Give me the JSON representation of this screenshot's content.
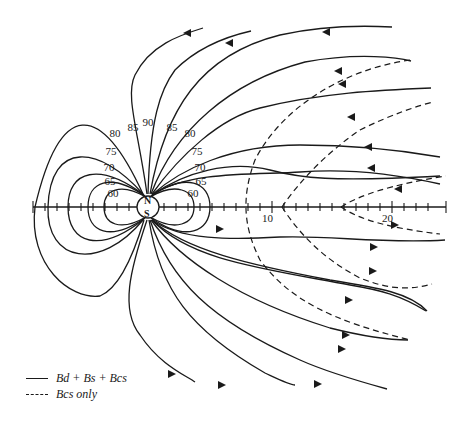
{
  "diagram": {
    "type": "magnetic-field-lines",
    "earth": {
      "north_label": "N",
      "south_label": "S"
    },
    "axis": {
      "tick_labels": [
        "10",
        "20"
      ],
      "range_min": -10,
      "range_max": 25
    },
    "latitude_labels_left": [
      "80",
      "85",
      "75",
      "70",
      "65",
      "60"
    ],
    "latitude_labels_center": [
      "90"
    ],
    "latitude_labels_right": [
      "85",
      "80",
      "75",
      "70",
      "65",
      "60"
    ],
    "labels": {
      "lat_90": "90",
      "lat_85_l": "85",
      "lat_85_r": "85",
      "lat_80_l": "80",
      "lat_80_r": "80",
      "lat_75_l": "75",
      "lat_75_r": "75",
      "lat_70_l": "70",
      "lat_70_r": "70",
      "lat_65_l": "65",
      "lat_65_r": "65",
      "lat_60_l": "60",
      "lat_60_r": "60",
      "tick_10": "10",
      "tick_20": "20"
    }
  },
  "legend": {
    "items": [
      {
        "style": "solid",
        "label": "B_d + B_s + B_cs",
        "display": "Bd + Bs + Bcs"
      },
      {
        "style": "dashed",
        "label": "B_cs only",
        "display": "Bcs only"
      }
    ]
  }
}
